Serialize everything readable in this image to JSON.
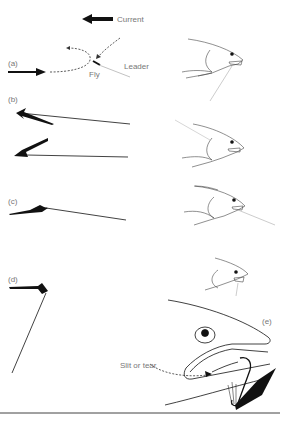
{
  "diagram": {
    "current": {
      "label": "Current",
      "icon": "arrow-left-icon"
    },
    "panels": [
      {
        "id": "a",
        "label": "(a)",
        "annotations": {
          "fly": "Fly",
          "leader": "Leader"
        }
      },
      {
        "id": "b",
        "label": "(b)"
      },
      {
        "id": "c",
        "label": "(c)"
      },
      {
        "id": "d",
        "label": "(d)"
      },
      {
        "id": "e",
        "label": "(e)",
        "annotations": {
          "slit": "Slit or tear"
        }
      }
    ],
    "colors": {
      "ink": "#111111",
      "label": "#777777",
      "faint": "#aaaaaa"
    }
  }
}
